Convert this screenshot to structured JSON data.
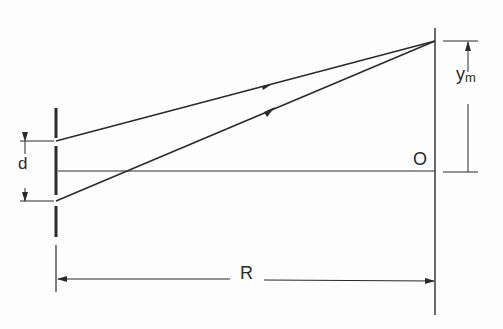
{
  "diagram": {
    "type": "double-slit interference geometry",
    "labels": {
      "slit_separation": "d",
      "fringe_position": "y",
      "fringe_position_subscript": "m",
      "origin": "O",
      "screen_distance": "R"
    },
    "colors": {
      "ink": "#2a2a2a",
      "background": "#fdfdfd"
    },
    "elements": [
      {
        "name": "barrier-with-two-slits",
        "x": 56
      },
      {
        "name": "screen",
        "x": 435
      },
      {
        "name": "ray-from-upper-slit",
        "from": [
          56,
          141
        ],
        "to": [
          435,
          41
        ]
      },
      {
        "name": "ray-from-lower-slit",
        "from": [
          56,
          201
        ],
        "to": [
          435,
          41
        ]
      },
      {
        "name": "central-axis",
        "from": [
          56,
          171
        ],
        "to": [
          435,
          171
        ]
      }
    ]
  }
}
